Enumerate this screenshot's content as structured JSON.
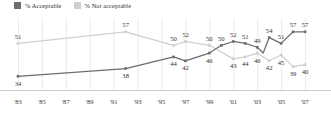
{
  "legend": {
    "items": [
      {
        "label": "% Acceptable",
        "color": "#6d6d6d",
        "icon": "legend-swatch-acceptable"
      },
      {
        "label": "% Not acceptable",
        "color": "#cfcfcf",
        "icon": "legend-swatch-not-acceptable"
      }
    ]
  },
  "chart_data": {
    "type": "line",
    "title": "",
    "subtitle": "",
    "xlabel": "",
    "ylabel": "",
    "ylim": [
      30,
      60
    ],
    "xlim": [
      1983,
      2008
    ],
    "grid": "vertical",
    "legend_position": "top-left",
    "tick_labels": [
      "'83",
      "'85",
      "'87",
      "'89",
      "'91",
      "'93",
      "'95",
      "'97",
      "'99",
      "'01",
      "'03",
      "'05",
      "'07"
    ],
    "tick_years": [
      1983,
      1985,
      1987,
      1989,
      1991,
      1993,
      1995,
      1997,
      1999,
      2001,
      2003,
      2005,
      2007
    ],
    "series": [
      {
        "name": "% Acceptable",
        "color": "#6d6d6d",
        "points": [
          {
            "year": 1983,
            "value": 34,
            "label": "34",
            "label_pos": "below"
          },
          {
            "year": 1992,
            "value": 38,
            "label": "38",
            "label_pos": "below"
          },
          {
            "year": 1996,
            "value": 44,
            "label": "44",
            "label_pos": "below"
          },
          {
            "year": 1997,
            "value": 42,
            "label": "42",
            "label_pos": "below"
          },
          {
            "year": 1999,
            "value": 46,
            "label": "46",
            "label_pos": "below"
          },
          {
            "year": 2000,
            "value": 50,
            "label": "50",
            "label_pos": "above"
          },
          {
            "year": 2001,
            "value": 52,
            "label": "52",
            "label_pos": "above"
          },
          {
            "year": 2002,
            "value": 51,
            "label": "51",
            "label_pos": "above"
          },
          {
            "year": 2003,
            "value": 49,
            "label": "49",
            "label_pos": "above"
          },
          {
            "year": 2003.5,
            "value": 46,
            "label": "",
            "label_pos": "none"
          },
          {
            "year": 2004,
            "value": 54,
            "label": "54",
            "label_pos": "above"
          },
          {
            "year": 2005,
            "value": 51,
            "label": "51",
            "label_pos": "above"
          },
          {
            "year": 2006,
            "value": 57,
            "label": "57",
            "label_pos": "above"
          },
          {
            "year": 2007,
            "value": 57,
            "label": "57",
            "label_pos": "above"
          }
        ]
      },
      {
        "name": "% Not acceptable",
        "color": "#cfcfcf",
        "points": [
          {
            "year": 1983,
            "value": 51,
            "label": "51",
            "label_pos": "above"
          },
          {
            "year": 1992,
            "value": 57,
            "label": "57",
            "label_pos": "above"
          },
          {
            "year": 1996,
            "value": 50,
            "label": "50",
            "label_pos": "above"
          },
          {
            "year": 1997,
            "value": 52,
            "label": "52",
            "label_pos": "above"
          },
          {
            "year": 1999,
            "value": 50,
            "label": "50",
            "label_pos": "above"
          },
          {
            "year": 2001,
            "value": 43,
            "label": "43",
            "label_pos": "below"
          },
          {
            "year": 2002,
            "value": 44,
            "label": "44",
            "label_pos": "below"
          },
          {
            "year": 2003,
            "value": 46,
            "label": "46",
            "label_pos": "below"
          },
          {
            "year": 2004,
            "value": 42,
            "label": "42",
            "label_pos": "below"
          },
          {
            "year": 2005,
            "value": 45,
            "label": "45",
            "label_pos": "below"
          },
          {
            "year": 2006,
            "value": 39,
            "label": "39",
            "label_pos": "below"
          },
          {
            "year": 2007,
            "value": 40,
            "label": "40",
            "label_pos": "below"
          }
        ]
      }
    ]
  }
}
